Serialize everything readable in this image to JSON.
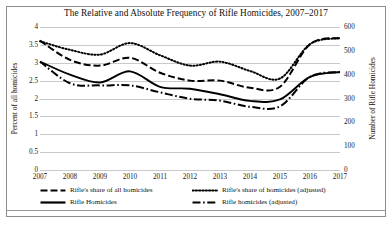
{
  "chart_data": {
    "type": "line",
    "title": "The Relative and Absolute Frequency of Rifle Homicides, 2007–2017",
    "xlabel": "",
    "ylabel": "Percent of all homicides",
    "y2label": "Number of Rifle Homicides",
    "x": [
      2007,
      2008,
      2009,
      2010,
      2011,
      2012,
      2013,
      2014,
      2015,
      2016,
      2017
    ],
    "xtick_labels": [
      "2007",
      "2008",
      "2009",
      "2010",
      "2011",
      "2012",
      "2013",
      "2014",
      "2015",
      "2016",
      "2017"
    ],
    "ylim": [
      0,
      4
    ],
    "ytick_labels": [
      "4",
      "3.5",
      "3",
      "2.5",
      "2",
      "1.5",
      "1",
      "0.5",
      "0"
    ],
    "ytick_values": [
      4,
      3.5,
      3,
      2.5,
      2,
      1.5,
      1,
      0.5,
      0
    ],
    "y2lim": [
      0,
      600
    ],
    "y2tick_labels": [
      "600",
      "500",
      "400",
      "300",
      "200",
      "100",
      "0"
    ],
    "y2tick_values": [
      600,
      500,
      400,
      300,
      200,
      100,
      0
    ],
    "grid": true,
    "legend_position": "bottom",
    "series": [
      {
        "name": "Rifle's share of all homicides",
        "axis": "left",
        "style": "dashed",
        "values": [
          3.62,
          3.08,
          2.92,
          3.14,
          2.72,
          2.5,
          2.5,
          2.3,
          2.33,
          3.52,
          3.69
        ]
      },
      {
        "name": "Rifle's share of homicides (adjusted)",
        "axis": "left",
        "style": "dotted",
        "values": [
          3.6,
          3.36,
          3.23,
          3.55,
          3.21,
          2.92,
          3.03,
          2.77,
          2.56,
          3.52,
          3.69
        ]
      },
      {
        "name": "Rifle Homicides",
        "axis": "right",
        "style": "solid",
        "values": [
          455,
          400,
          367,
          414,
          349,
          341,
          318,
          290,
          296,
          391,
          411
        ]
      },
      {
        "name": "Rifle homicides (adjusted)",
        "axis": "right",
        "style": "dashdot",
        "values": [
          455,
          364,
          355,
          355,
          326,
          299,
          291,
          265,
          267,
          391,
          411
        ]
      }
    ]
  },
  "legend": {
    "items": [
      {
        "label": "Rifle's share of all homicides",
        "style": "dashed"
      },
      {
        "label": "Rifle's share of homicides (adjusted)",
        "style": "dotted"
      },
      {
        "label": "Rifle Homicides",
        "style": "solid"
      },
      {
        "label": "Rifle homicides (adjusted)",
        "style": "dashdot"
      }
    ]
  },
  "colors": {
    "line": "#000000",
    "grid": "#c9c9c9",
    "frame": "#8d8d8d",
    "text": "#111111",
    "background": "#ffffff"
  }
}
